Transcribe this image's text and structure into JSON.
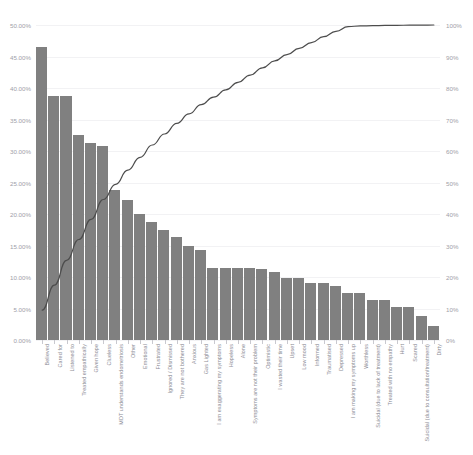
{
  "chart_title": "",
  "chart_data": {
    "type": "bar",
    "title": "",
    "subtitle": "",
    "xlabel": "",
    "ylabel": "",
    "ylim": [
      0,
      50
    ],
    "y2lim": [
      0,
      100
    ],
    "grid": true,
    "legend": false,
    "legend_position": "none",
    "bar_color": "#808080",
    "line_color": "#4d4d4d",
    "background": "#ffffff",
    "y_tick_labels": [
      "0.00%",
      "5.00%",
      "10.00%",
      "15.00%",
      "20.00%",
      "25.00%",
      "30.00%",
      "35.00%",
      "40.00%",
      "45.00%",
      "50.00%"
    ],
    "y_tick_values": [
      0,
      5,
      10,
      15,
      20,
      25,
      30,
      35,
      40,
      45,
      50
    ],
    "y2_tick_labels": [
      "0%",
      "10%",
      "20%",
      "30%",
      "40%",
      "50%",
      "60%",
      "70%",
      "80%",
      "90%",
      "100%"
    ],
    "y2_tick_values": [
      0,
      10,
      20,
      30,
      40,
      50,
      60,
      70,
      80,
      90,
      100
    ],
    "categories": [
      "Believed",
      "Cared for",
      "Listened to",
      "Treated empathically",
      "Given hope",
      "Clueless",
      "MDT understands endometriosis",
      "Other",
      "Emotional",
      "Frustrated",
      "Ignored / Dismissed",
      "They are not bothered",
      "Anxious",
      "Gas Lighted",
      "I am exaggerating my symptoms",
      "Hopeless",
      "Alone",
      "Symptoms are not their problem",
      "Optimistic",
      "I wasted their time",
      "Upset",
      "Low mood",
      "Informed",
      "Traumatised",
      "Depressed",
      "I am making my symptoms up",
      "Worthless",
      "Suicidal (due to lack of treatment)",
      "Treated with no empathy",
      "Hurt",
      "Scared",
      "Suicidal (due to consultation/treatment)",
      "Dirty"
    ],
    "series": [
      {
        "name": "Percentage",
        "axis": "left",
        "type": "bar",
        "values": [
          46.5,
          38.8,
          38.8,
          32.5,
          31.3,
          30.8,
          23.8,
          22.3,
          20.0,
          18.8,
          17.5,
          16.3,
          15.0,
          14.3,
          11.5,
          11.5,
          11.5,
          11.5,
          11.3,
          10.8,
          9.8,
          9.8,
          9.0,
          9.0,
          8.5,
          7.5,
          7.5,
          6.3,
          6.3,
          5.3,
          5.3,
          3.8,
          2.3
        ]
      },
      {
        "name": "Cumulative",
        "axis": "right",
        "type": "line",
        "values": [
          9.5,
          17.4,
          25.3,
          31.9,
          38.3,
          44.6,
          49.4,
          53.9,
          58.0,
          61.9,
          65.4,
          68.8,
          71.8,
          74.7,
          77.1,
          79.4,
          81.8,
          84.1,
          86.4,
          88.6,
          90.6,
          92.6,
          94.4,
          96.3,
          98.0,
          99.5,
          99.7,
          99.8,
          99.85,
          99.9,
          99.93,
          99.97,
          100.0
        ]
      }
    ]
  }
}
